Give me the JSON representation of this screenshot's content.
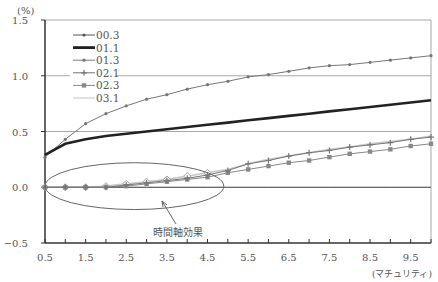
{
  "chart_data": {
    "type": "line",
    "title": "",
    "ylabel": "(%)",
    "xlabel": "(マチュリティ)",
    "ylim": [
      -0.5,
      1.5
    ],
    "xlim": [
      0.5,
      10.0
    ],
    "yticks": [
      "1.5",
      "1.0",
      "0.5",
      "0.0",
      "−0.5"
    ],
    "yticks_values": [
      1.5,
      1.0,
      0.5,
      0.0,
      -0.5
    ],
    "xticks": [
      "0.5",
      "1.5",
      "2.5",
      "3.5",
      "4.5",
      "5.5",
      "6.5",
      "7.5",
      "8.5",
      "9.5"
    ],
    "xticks_values": [
      0.5,
      1.5,
      2.5,
      3.5,
      4.5,
      5.5,
      6.5,
      7.5,
      8.5,
      9.5
    ],
    "grid": "horizontal",
    "legend_position": "upper-left",
    "x": [
      0.5,
      1.0,
      1.5,
      2.0,
      2.5,
      3.0,
      3.5,
      4.0,
      4.5,
      5.0,
      5.5,
      6.0,
      6.5,
      7.0,
      7.5,
      8.0,
      8.5,
      9.0,
      9.5,
      10.0
    ],
    "series": [
      {
        "name": "00.3",
        "style": "thin-dot",
        "color": "#555555",
        "values": [
          0.0,
          0.0,
          0.0,
          0.0,
          0.0,
          0.0,
          0.0,
          0.0,
          0.0,
          0.0,
          0.0,
          0.0,
          0.0,
          0.0,
          0.0,
          0.0,
          0.0,
          0.0,
          0.0,
          0.0
        ]
      },
      {
        "name": "01.1",
        "style": "thick",
        "color": "#222222",
        "values": [
          0.29,
          0.39,
          0.43,
          0.46,
          0.48,
          0.5,
          0.52,
          0.54,
          0.56,
          0.58,
          0.6,
          0.62,
          0.64,
          0.66,
          0.68,
          0.7,
          0.72,
          0.74,
          0.76,
          0.78
        ]
      },
      {
        "name": "01.3",
        "style": "dot-marker",
        "color": "#777777",
        "values": [
          0.27,
          0.43,
          0.57,
          0.66,
          0.73,
          0.79,
          0.83,
          0.88,
          0.92,
          0.95,
          0.99,
          1.01,
          1.04,
          1.07,
          1.09,
          1.1,
          1.12,
          1.14,
          1.16,
          1.18
        ]
      },
      {
        "name": "02.1",
        "style": "plus-marker",
        "color": "#777777",
        "values": [
          0.0,
          0.0,
          0.0,
          0.0,
          0.02,
          0.04,
          0.06,
          0.08,
          0.11,
          0.15,
          0.21,
          0.24,
          0.28,
          0.31,
          0.33,
          0.36,
          0.38,
          0.4,
          0.43,
          0.45
        ]
      },
      {
        "name": "02.3",
        "style": "square-marker",
        "color": "#888888",
        "values": [
          0.0,
          0.0,
          0.0,
          0.0,
          0.01,
          0.03,
          0.05,
          0.07,
          0.09,
          0.13,
          0.16,
          0.19,
          0.22,
          0.24,
          0.27,
          0.3,
          0.32,
          0.34,
          0.37,
          0.39
        ]
      },
      {
        "name": "03.1",
        "style": "light-diamond",
        "color": "#c8c8c8",
        "values": [
          0.0,
          0.0,
          0.0,
          0.01,
          0.03,
          0.05,
          0.07,
          0.1,
          0.13,
          0.16,
          0.21,
          0.25,
          0.28,
          0.31,
          0.34,
          0.36,
          0.39,
          0.41,
          0.43,
          0.46
        ]
      }
    ],
    "annotations": [
      {
        "text": "時間軸効果",
        "type": "ellipse-with-arrow",
        "target_x_range": [
          0.5,
          4.9
        ],
        "target_y_range": [
          -0.2,
          0.22
        ]
      }
    ]
  }
}
